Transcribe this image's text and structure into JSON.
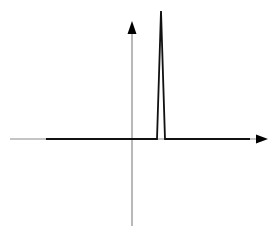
{
  "diagram": {
    "colors": {
      "background": "#ffffff",
      "axis": "#8a8a8a",
      "signal": "#111111",
      "arrowhead": "#000000"
    },
    "axes": {
      "x_axis": {
        "x_start": 10,
        "x_end": 258,
        "y": 139,
        "arrow_tip_x": 268
      },
      "y_axis": {
        "x": 132,
        "y_start": 226,
        "y_end": 32,
        "arrow_tip_y": 21
      }
    },
    "signal": {
      "type": "narrow-triangular-pulse",
      "points": [
        [
          46,
          139
        ],
        [
          157,
          139
        ],
        [
          161,
          11
        ],
        [
          165,
          139
        ],
        [
          250,
          139
        ]
      ]
    }
  }
}
